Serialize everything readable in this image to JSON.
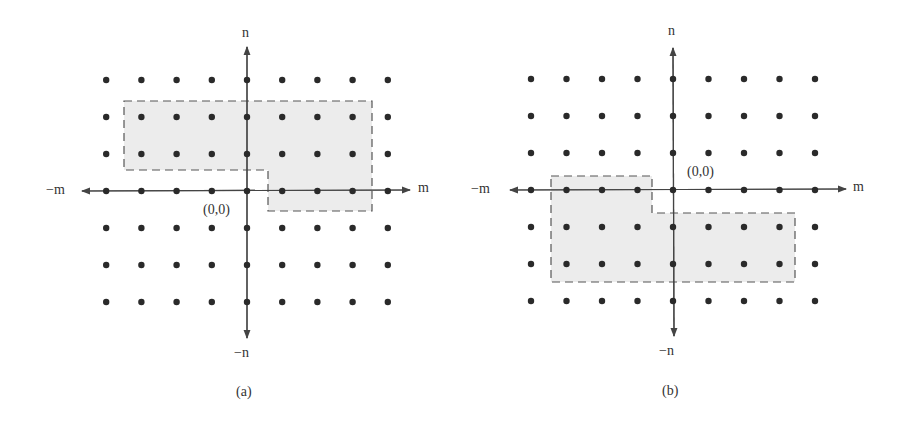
{
  "panels": [
    {
      "id": "a",
      "caption": "(a)",
      "origin_label": "(0,0)",
      "axis_labels": {
        "pos_x": "m",
        "neg_x": "−m",
        "pos_y": "n",
        "neg_y": "−n"
      },
      "grid": {
        "cols": [
          -4,
          -3,
          -2,
          -1,
          0,
          1,
          2,
          3,
          4
        ],
        "rows": [
          3,
          2,
          1,
          0,
          -1,
          -2,
          -3
        ]
      },
      "region": "upper half-plane support region (dashed, shaded): rows n=1..2 for m=-3..3, plus row n=0 for m=1..3"
    },
    {
      "id": "b",
      "caption": "(b)",
      "origin_label": "(0,0)",
      "axis_labels": {
        "pos_x": "m",
        "neg_x": "−m",
        "pos_y": "n",
        "neg_y": "−n"
      },
      "grid": {
        "cols": [
          -4,
          -3,
          -2,
          -1,
          0,
          1,
          2,
          3,
          4
        ],
        "rows": [
          3,
          2,
          1,
          0,
          -1,
          -2,
          -3
        ]
      },
      "region": "lower half-plane support region (dashed, shaded): row n=0 for m=-3..-1, plus rows n=-1..-2 for m=-3..3"
    }
  ]
}
